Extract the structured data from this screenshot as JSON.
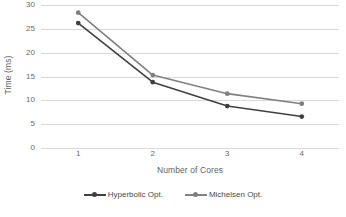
{
  "chart_data": {
    "type": "line",
    "title": "",
    "xlabel": "Number of Cores",
    "ylabel": "Time (ms)",
    "categories": [
      "1",
      "2",
      "3",
      "4"
    ],
    "x": [
      1,
      2,
      3,
      4
    ],
    "ylim": [
      0,
      30
    ],
    "yticks": [
      0,
      5,
      10,
      15,
      20,
      25,
      30
    ],
    "ytick_labels": [
      "0",
      "5",
      "10",
      "15",
      "20",
      "25",
      "30"
    ],
    "grid": "horizontal",
    "legend_position": "bottom-center",
    "series": [
      {
        "name": "Hyperbolic Opt.",
        "color": "#404040",
        "marker": "circle",
        "values": [
          26.2,
          13.8,
          8.8,
          6.6
        ]
      },
      {
        "name": "Michelsen Opt.",
        "color": "#808080",
        "marker": "circle",
        "values": [
          28.4,
          15.3,
          11.4,
          9.3
        ]
      }
    ]
  },
  "colors": {
    "gridline": "#d9d9d9",
    "tick_text": "#6a6a6a",
    "axis_title": "#5f5f5f",
    "background": "#ffffff"
  }
}
